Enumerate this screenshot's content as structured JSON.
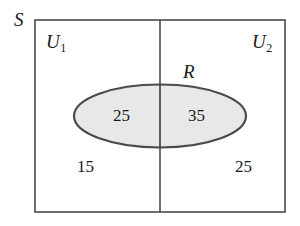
{
  "figure": {
    "type": "venn-diagram",
    "background_color": "#ffffff",
    "stroke_color": "#4a4a4a",
    "ellipse_fill_color": "#e8e8e8",
    "text_color": "#1a1a1a"
  },
  "universe": {
    "label": "S",
    "description": "outer rectangle sample space"
  },
  "partitions": [
    {
      "label": "U",
      "subscript": "1",
      "position": "left"
    },
    {
      "label": "U",
      "subscript": "2",
      "position": "right"
    }
  ],
  "set": {
    "label": "R",
    "description": "shaded ellipse spanning both partitions"
  },
  "regions": [
    {
      "name": "R-and-U1",
      "value": "25",
      "inside_set": true,
      "partition": "U1"
    },
    {
      "name": "R-and-U2",
      "value": "35",
      "inside_set": true,
      "partition": "U2"
    },
    {
      "name": "not-R-and-U1",
      "value": "15",
      "inside_set": false,
      "partition": "U1"
    },
    {
      "name": "not-R-and-U2",
      "value": "25",
      "inside_set": false,
      "partition": "U2"
    }
  ],
  "geometry": {
    "rect": {
      "x": 35,
      "y": 20,
      "width": 250,
      "height": 192
    },
    "divider_x": 160,
    "ellipse": {
      "cx": 160,
      "cy": 116,
      "rx": 86,
      "ry": 31.5
    }
  }
}
